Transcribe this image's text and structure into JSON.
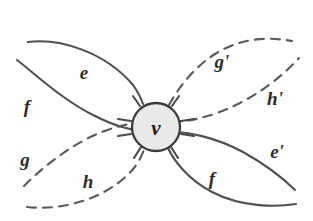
{
  "figure": {
    "kind": "hand-drawn-diagram",
    "title": "",
    "background_color": "#fefefe",
    "ink_color": "#4a4a4a",
    "label_color": "#2b2b2b",
    "width": 313,
    "height": 221
  },
  "vertex": {
    "label": "ν",
    "name": "nu-vertex",
    "fill_color": "#e8e8e8",
    "stroke_color": "#3d3d3d",
    "center_x": 156,
    "center_y": 127,
    "radius": 24
  },
  "lobes": [
    {
      "name": "upper-left-lobe",
      "style": "solid",
      "upper_edge_label": "e",
      "lower_edge_label": "f"
    },
    {
      "name": "lower-left-lobe",
      "style": "dashed",
      "upper_edge_label": "g",
      "lower_edge_label": "h"
    },
    {
      "name": "upper-right-lobe",
      "style": "dashed",
      "upper_edge_label": "g'",
      "lower_edge_label": "h'"
    },
    {
      "name": "lower-right-lobe",
      "style": "solid",
      "upper_edge_label": "e'",
      "lower_edge_label": "f"
    }
  ],
  "labels": {
    "e": "e",
    "f": "f",
    "g": "g",
    "h": "h",
    "g_prime": "g'",
    "h_prime": "h'",
    "e_prime": "e'",
    "f_prime": "f",
    "nu": "ν"
  },
  "label_positions": {
    "e": {
      "x": 84,
      "y": 79
    },
    "f": {
      "x": 27,
      "y": 113
    },
    "g": {
      "x": 25,
      "y": 166
    },
    "h": {
      "x": 88,
      "y": 188
    },
    "g_prime": {
      "x": 222,
      "y": 68
    },
    "h_prime": {
      "x": 275,
      "y": 105
    },
    "e_prime": {
      "x": 277,
      "y": 158
    },
    "f_prime": {
      "x": 212,
      "y": 185
    }
  }
}
